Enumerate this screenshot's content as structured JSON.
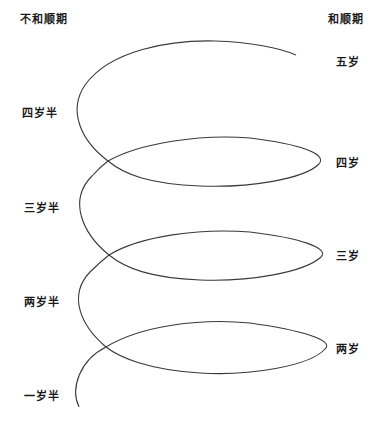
{
  "header": {
    "left": "不和顺期",
    "right": "和顺期"
  },
  "left_labels": [
    {
      "text": "四岁半",
      "y": 104
    },
    {
      "text": "三岁半",
      "y": 199
    },
    {
      "text": "两岁半",
      "y": 293
    },
    {
      "text": "一岁半",
      "y": 387
    }
  ],
  "right_labels": [
    {
      "text": "五岁",
      "y": 53
    },
    {
      "text": "四岁",
      "y": 154
    },
    {
      "text": "三岁",
      "y": 247
    },
    {
      "text": "两岁",
      "y": 340
    }
  ],
  "colors": {
    "line": "#3a3a3a",
    "text": "#1a1a1a",
    "background": "#ffffff"
  }
}
